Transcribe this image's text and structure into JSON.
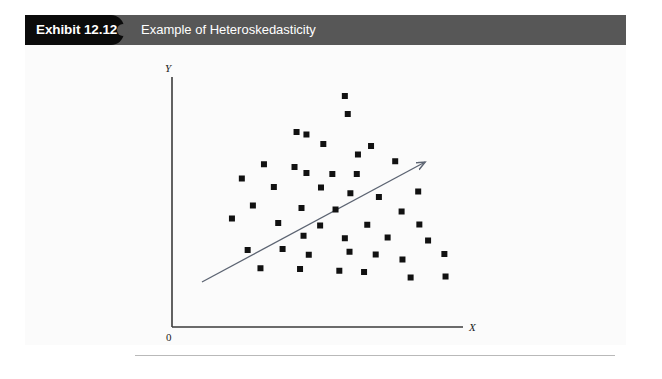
{
  "exhibit": {
    "number_label": "Exhibit 12.12",
    "title": "Example of Heteroskedasticity",
    "tag_color": "#0b0b0b",
    "banner_color": "#575757",
    "title_color": "#ffffff"
  },
  "figure": {
    "background": "#fbfbfb",
    "axis_color": "#3b3b3b",
    "point_color": "#111111",
    "trendline_color": "#5c6472",
    "origin_label": "0",
    "x_axis_label": "X",
    "y_axis_label": "Y"
  },
  "chart_data": {
    "type": "scatter",
    "title": "Example of Heteroskedasticity",
    "xlabel": "X",
    "ylabel": "Y",
    "origin_label": "0",
    "grid": false,
    "legend": "none",
    "axis_pixel_frame": {
      "origin_x": 172,
      "origin_y": 327,
      "y_axis_top": 77,
      "x_axis_right": 463
    },
    "xlim": [
      0,
      100
    ],
    "ylim": [
      0,
      100
    ],
    "note": "Scatter fans out (variance increases) as X increases — heteroskedasticity.",
    "points": [
      [
        59.4,
        92.4
      ],
      [
        60.4,
        85.2
      ],
      [
        42.8,
        78.0
      ],
      [
        46.2,
        77.0
      ],
      [
        52.0,
        73.2
      ],
      [
        68.4,
        72.4
      ],
      [
        63.9,
        69.0
      ],
      [
        76.7,
        66.3
      ],
      [
        31.6,
        65.1
      ],
      [
        42.1,
        64.0
      ],
      [
        46.2,
        61.6
      ],
      [
        55.1,
        61.2
      ],
      [
        63.5,
        61.2
      ],
      [
        24.0,
        59.4
      ],
      [
        35.0,
        56.0
      ],
      [
        51.2,
        55.8
      ],
      [
        61.3,
        53.5
      ],
      [
        84.6,
        54.2
      ],
      [
        71.1,
        52.0
      ],
      [
        27.8,
        48.6
      ],
      [
        44.5,
        47.6
      ],
      [
        56.2,
        47.0
      ],
      [
        78.9,
        46.2
      ],
      [
        20.6,
        43.4
      ],
      [
        36.5,
        41.6
      ],
      [
        50.9,
        40.6
      ],
      [
        67.1,
        40.9
      ],
      [
        85.0,
        41.0
      ],
      [
        45.2,
        36.5
      ],
      [
        59.4,
        35.5
      ],
      [
        74.1,
        35.8
      ],
      [
        88.0,
        34.6
      ],
      [
        26.0,
        30.8
      ],
      [
        38.0,
        31.2
      ],
      [
        47.0,
        28.9
      ],
      [
        61.0,
        30.1
      ],
      [
        70.0,
        29.0
      ],
      [
        79.2,
        27.0
      ],
      [
        93.6,
        29.2
      ],
      [
        30.4,
        23.5
      ],
      [
        44.0,
        23.2
      ],
      [
        57.5,
        22.5
      ],
      [
        66.0,
        22.0
      ],
      [
        82.0,
        19.8
      ],
      [
        94.0,
        20.2
      ]
    ],
    "trendline": {
      "type": "arrow",
      "x_start": 10.3,
      "y_start": 18.0,
      "x_end": 87.0,
      "y_end": 66.0
    }
  }
}
